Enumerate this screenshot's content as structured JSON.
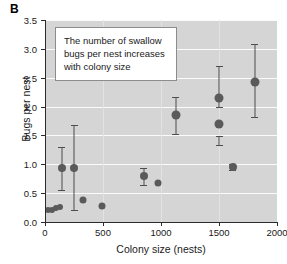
{
  "panel": {
    "label": "B"
  },
  "annotation": {
    "line1": "The number of swallow",
    "line2": "bugs per nest increases",
    "line3": "with colony size"
  },
  "chart_data": {
    "type": "scatter",
    "title": "",
    "xlabel": "Colony size (nests)",
    "ylabel": "Bugs per nest",
    "xlim": [
      0,
      2000
    ],
    "ylim": [
      0.0,
      3.5
    ],
    "xticks": [
      0,
      500,
      1000,
      1500,
      2000
    ],
    "xticklabels": [
      "0",
      "500",
      "1000",
      "1500",
      "2000"
    ],
    "yticks": [
      0.0,
      0.5,
      1.0,
      1.5,
      2.0,
      2.5,
      3.0,
      3.5
    ],
    "yticklabels": [
      "0.0",
      "0.5",
      "1.0",
      "1.5",
      "2.0",
      "2.5",
      "3.0",
      "3.5"
    ],
    "grid": "horizontal-white",
    "legend": "none",
    "marker_color": "#5a5a5a",
    "errorbar_color": "#4d4d4d",
    "plot_background": "#d5d5d5",
    "points": [
      {
        "x": 25,
        "y": 0.2,
        "yerr_low": null,
        "yerr_high": null,
        "size": 6
      },
      {
        "x": 60,
        "y": 0.21,
        "yerr_low": null,
        "yerr_high": null,
        "size": 6
      },
      {
        "x": 95,
        "y": 0.24,
        "yerr_low": null,
        "yerr_high": null,
        "size": 6
      },
      {
        "x": 130,
        "y": 0.26,
        "yerr_low": null,
        "yerr_high": null,
        "size": 6
      },
      {
        "x": 145,
        "y": 0.93,
        "yerr_low": 0.55,
        "yerr_high": 1.3,
        "size": 8
      },
      {
        "x": 250,
        "y": 0.93,
        "yerr_low": 0.21,
        "yerr_high": 1.68,
        "size": 8
      },
      {
        "x": 330,
        "y": 0.38,
        "yerr_low": null,
        "yerr_high": null,
        "size": 7
      },
      {
        "x": 490,
        "y": 0.27,
        "yerr_low": null,
        "yerr_high": null,
        "size": 7
      },
      {
        "x": 850,
        "y": 0.79,
        "yerr_low": 0.64,
        "yerr_high": 0.93,
        "size": 8
      },
      {
        "x": 975,
        "y": 0.68,
        "yerr_low": null,
        "yerr_high": null,
        "size": 7
      },
      {
        "x": 1125,
        "y": 1.85,
        "yerr_low": 1.53,
        "yerr_high": 2.17,
        "size": 9
      },
      {
        "x": 1500,
        "y": 2.15,
        "yerr_low": 2.0,
        "yerr_high": 2.71,
        "size": 9
      },
      {
        "x": 1500,
        "y": 1.7,
        "yerr_low": 1.34,
        "yerr_high": 1.49,
        "size": 9
      },
      {
        "x": 1620,
        "y": 0.95,
        "yerr_low": 0.9,
        "yerr_high": 1.0,
        "size": 8
      },
      {
        "x": 1810,
        "y": 2.43,
        "yerr_low": 1.82,
        "yerr_high": 3.08,
        "size": 9
      }
    ]
  }
}
